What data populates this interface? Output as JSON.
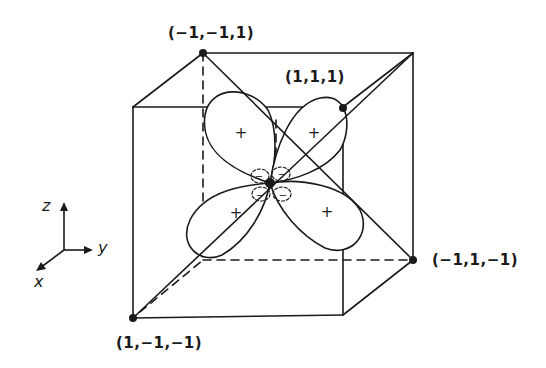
{
  "diagram": {
    "type": "orbital-in-cube",
    "vertices": [
      {
        "label": "(−1,−1,1)",
        "x": 203,
        "y": 53
      },
      {
        "label": "(1,1,1)",
        "x": 343,
        "y": 108
      },
      {
        "label": "(−1,1,−1)",
        "x": 413,
        "y": 260
      },
      {
        "label": "(1,−1,−1)",
        "x": 133,
        "y": 318
      }
    ],
    "lobe_signs": {
      "large": [
        "+",
        "+",
        "+",
        "+"
      ],
      "small": [
        "−",
        "−",
        "−",
        "−"
      ]
    },
    "axes": {
      "z": "z",
      "y": "y",
      "x": "x"
    },
    "colors": {
      "line": "#1a1a1a",
      "background": "#ffffff"
    }
  }
}
